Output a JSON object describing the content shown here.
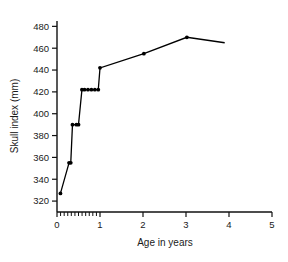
{
  "chart_data": {
    "type": "line",
    "title": "",
    "xlabel": "Age in years",
    "ylabel": "Skull index (mm)",
    "xlim": [
      0,
      5
    ],
    "ylim": [
      310,
      484
    ],
    "grid": false,
    "legend": "none",
    "x_ticks": [
      0,
      1,
      2,
      3,
      4,
      5
    ],
    "x_tick_labels": [
      "0",
      "1",
      "2",
      "3",
      "4",
      "5"
    ],
    "x_minor_ticks": [
      0.083,
      0.167,
      0.25,
      0.333,
      0.417,
      0.5,
      0.583,
      0.667,
      0.75,
      0.833,
      0.917
    ],
    "y_ticks": [
      320,
      340,
      360,
      380,
      400,
      420,
      440,
      460,
      480
    ],
    "y_tick_labels": [
      "320",
      "340",
      "360",
      "380",
      "400",
      "420",
      "440",
      "460",
      "480"
    ],
    "series": [
      {
        "name": "Skull index",
        "x": [
          0.08,
          0.28,
          0.32,
          0.36,
          0.45,
          0.5,
          0.58,
          0.64,
          0.72,
          0.8,
          0.88,
          0.96,
          1.0,
          2.02,
          3.02,
          3.9
        ],
        "y": [
          327,
          355,
          355,
          390,
          390,
          390,
          422,
          422,
          422,
          422,
          422,
          422,
          442,
          455,
          470,
          465
        ],
        "markers": [
          true,
          true,
          true,
          true,
          true,
          true,
          true,
          true,
          true,
          true,
          true,
          true,
          true,
          true,
          true,
          false
        ]
      }
    ],
    "annotations": []
  }
}
